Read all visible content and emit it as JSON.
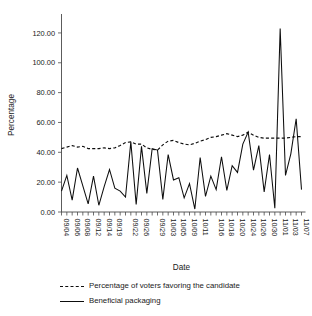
{
  "chart_data": {
    "type": "line",
    "title": "",
    "xlabel": "Date",
    "ylabel": "Percentage",
    "ylim": [
      0,
      130
    ],
    "ytick_labels": [
      "0.00",
      "20.00",
      "40.00",
      "60.00",
      "80.00",
      "100.00",
      "120.00"
    ],
    "ytick_values": [
      0,
      20,
      40,
      60,
      80,
      100,
      120
    ],
    "grid": false,
    "legend_position": "below",
    "xtick_labels": [
      "09/04",
      "09/06",
      "09/08",
      "09/12",
      "09/14",
      "09/19",
      "09/22",
      "09/26",
      "09/29",
      "10/03",
      "10/05",
      "10/09",
      "10/11",
      "10/16",
      "10/18",
      "10/20",
      "10/24",
      "10/26",
      "10/30",
      "11/01",
      "11/03",
      "11/07"
    ],
    "x": [
      "09/04",
      "09/05",
      "09/06",
      "09/07",
      "09/08",
      "09/11",
      "09/12",
      "09/13",
      "09/14",
      "09/18",
      "09/19",
      "09/20",
      "09/21",
      "09/22",
      "09/25",
      "09/26",
      "09/27",
      "09/28",
      "09/29",
      "10/02",
      "10/03",
      "10/04",
      "10/05",
      "10/06",
      "10/09",
      "10/10",
      "10/11",
      "10/12",
      "10/13",
      "10/16",
      "10/17",
      "10/18",
      "10/19",
      "10/20",
      "10/23",
      "10/24",
      "10/25",
      "10/26",
      "10/27",
      "10/30",
      "10/31",
      "11/01",
      "11/02",
      "11/03",
      "11/06",
      "11/07"
    ],
    "series": [
      {
        "name": "Percentage of voters favoring the candidate",
        "style": "dashed",
        "values": [
          42.5,
          43.5,
          44.5,
          43.5,
          44.0,
          42.5,
          42.5,
          42.5,
          43.0,
          42.5,
          43.0,
          44.5,
          46.5,
          47.0,
          45.5,
          45.5,
          43.0,
          42.0,
          41.5,
          45.0,
          47.5,
          48.0,
          46.5,
          45.5,
          45.0,
          46.0,
          47.5,
          48.5,
          50.0,
          50.5,
          51.5,
          52.5,
          51.5,
          50.5,
          51.5,
          53.5,
          51.5,
          50.0,
          49.5,
          49.5,
          49.5,
          49.5,
          49.5,
          50.0,
          50.5,
          50.5
        ]
      },
      {
        "name": "Beneficial packaging",
        "style": "solid",
        "values": [
          14.0,
          24.5,
          8.0,
          29.5,
          17.5,
          5.5,
          24.0,
          4.5,
          17.0,
          28.5,
          16.0,
          14.0,
          10.0,
          47.0,
          5.0,
          44.0,
          12.5,
          42.5,
          41.5,
          8.5,
          38.5,
          21.5,
          23.0,
          9.5,
          19.0,
          2.0,
          36.5,
          10.5,
          24.0,
          15.0,
          37.0,
          14.5,
          31.0,
          26.5,
          45.5,
          53.5,
          28.0,
          44.5,
          13.5,
          38.5,
          2.5,
          123.0,
          24.5,
          39.0,
          62.5,
          15.0
        ]
      }
    ]
  },
  "legend": {
    "voters_label": "Percentage of voters favoring the candidate",
    "packaging_label": "Beneficial packaging"
  },
  "axes": {
    "y_title": "Percentage",
    "x_title": "Date"
  }
}
